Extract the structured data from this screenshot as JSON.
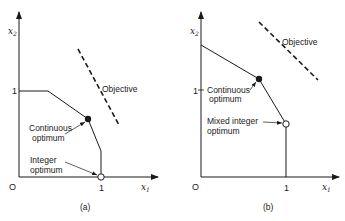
{
  "figure": {
    "panels": [
      {
        "id": "a",
        "caption": "(a)",
        "axes": {
          "x_label": "x",
          "x_sub": "1",
          "y_label": "x",
          "y_sub": "2",
          "origin": "O",
          "x_tick": "1",
          "y_tick": "1"
        },
        "objective_label": "Objective",
        "continuous_label_1": "Continuous",
        "continuous_label_2": "optimum",
        "integer_label_1": "Integer",
        "integer_label_2": "optimum"
      },
      {
        "id": "b",
        "caption": "(b)",
        "axes": {
          "x_label": "x",
          "x_sub": "1",
          "y_label": "x",
          "y_sub": "2",
          "origin": "O",
          "x_tick": "1",
          "y_tick": "1"
        },
        "objective_label": "Objective",
        "continuous_label_1": "Continuous",
        "continuous_label_2": "optimum",
        "integer_label_1": "Mixed integer",
        "integer_label_2": "optimum"
      }
    ],
    "colors": {
      "ink": "#1a1a1a",
      "background": "#ffffff"
    }
  }
}
